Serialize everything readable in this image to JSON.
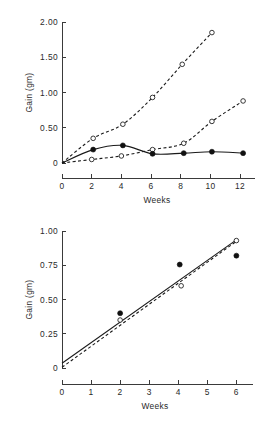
{
  "figure": {
    "background": "#ffffff",
    "ink_color": "#1a1a1a"
  },
  "chart_data": [
    {
      "id": "top",
      "type": "line",
      "title": "",
      "xlabel": "Weeks",
      "ylabel": "Gain (gm)",
      "xlim": [
        0,
        12.8
      ],
      "ylim": [
        0,
        2.0
      ],
      "xticks": [
        0,
        2,
        4,
        6,
        8,
        10,
        12
      ],
      "xticklabels": [
        "0",
        "2",
        "4",
        "6",
        "8",
        "10",
        "12"
      ],
      "yticks": [
        0,
        0.5,
        1.0,
        1.5,
        2.0
      ],
      "yticklabels": [
        "0",
        "0.50",
        "1.00",
        "1.50",
        "2.00"
      ],
      "grid": false,
      "legend": "none",
      "series": [
        {
          "name": "steep-dashed-open",
          "style": "dashed",
          "marker": "open-circle",
          "x": [
            0,
            2.1,
            4.1,
            6.1,
            8.1,
            10.1
          ],
          "y": [
            0.0,
            0.35,
            0.55,
            0.93,
            1.4,
            1.85
          ]
        },
        {
          "name": "shallow-dashed-open",
          "style": "dashed",
          "marker": "open-circle",
          "x": [
            0,
            2,
            4,
            6.1,
            8.2,
            10.1,
            12.2
          ],
          "y": [
            0.0,
            0.05,
            0.1,
            0.19,
            0.28,
            0.59,
            0.88
          ]
        },
        {
          "name": "flat-solid-filled",
          "style": "solid",
          "marker": "filled-circle",
          "x": [
            0,
            2.1,
            4.1,
            6.1,
            8.2,
            10.1,
            12.2
          ],
          "y": [
            0.0,
            0.19,
            0.25,
            0.13,
            0.14,
            0.16,
            0.14
          ]
        }
      ]
    },
    {
      "id": "bottom",
      "type": "line",
      "title": "",
      "xlabel": "Weeks",
      "ylabel": "Gain (gm)",
      "xlim": [
        0,
        6.4
      ],
      "ylim": [
        0,
        1.0
      ],
      "xticks": [
        0,
        1,
        2,
        3,
        4,
        5,
        6
      ],
      "xticklabels": [
        "0",
        "1",
        "2",
        "3",
        "4",
        "5",
        "6"
      ],
      "yticks": [
        0,
        0.25,
        0.5,
        0.75,
        1.0
      ],
      "yticklabels": [
        "0",
        "0.25",
        "0.50",
        "0.75",
        "1.00"
      ],
      "grid": false,
      "legend": "none",
      "series": [
        {
          "name": "regression-solid",
          "style": "solid",
          "marker": "none",
          "x": [
            0,
            6.0
          ],
          "y": [
            0.035,
            0.935
          ]
        },
        {
          "name": "regression-dashed",
          "style": "dashed",
          "marker": "none",
          "x": [
            0,
            6.0
          ],
          "y": [
            0.005,
            0.925
          ]
        },
        {
          "name": "filled-points",
          "style": "none",
          "marker": "filled-circle",
          "x": [
            2.0,
            4.05,
            6.0
          ],
          "y": [
            0.4,
            0.755,
            0.82
          ]
        },
        {
          "name": "open-points",
          "style": "none",
          "marker": "open-circle",
          "x": [
            2.0,
            4.1,
            6.0
          ],
          "y": [
            0.35,
            0.6,
            0.93
          ]
        }
      ]
    }
  ]
}
